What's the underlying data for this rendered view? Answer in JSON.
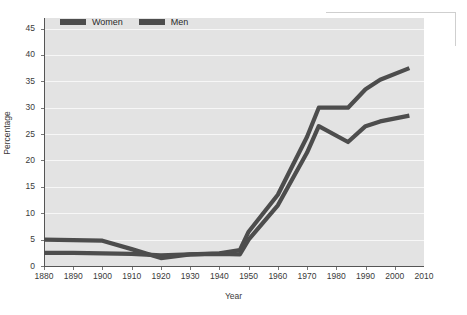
{
  "chart_data": {
    "type": "line",
    "title": "",
    "xlabel": "Year",
    "ylabel": "Percentage",
    "xlim": [
      1880,
      2010
    ],
    "ylim": [
      0,
      47
    ],
    "xticks": [
      1880,
      1890,
      1900,
      1910,
      1920,
      1930,
      1940,
      1950,
      1960,
      1970,
      1980,
      1990,
      2000,
      2010
    ],
    "yticks": [
      0,
      5,
      10,
      15,
      20,
      25,
      30,
      35,
      40,
      45
    ],
    "grid": "horizontal",
    "legend_position": "top-left-inside",
    "series": [
      {
        "name": "Women",
        "color": "#4d4d4d",
        "x": [
          1880,
          1890,
          1900,
          1910,
          1920,
          1930,
          1940,
          1947,
          1950,
          1960,
          1970,
          1974,
          1984,
          1990,
          1995,
          2005
        ],
        "values": [
          5.0,
          4.9,
          4.8,
          3.2,
          1.5,
          2.2,
          2.4,
          3.0,
          6.5,
          13.5,
          24.5,
          30.0,
          30.0,
          33.5,
          35.3,
          37.5
        ]
      },
      {
        "name": "Men",
        "color": "#4d4d4d",
        "x": [
          1880,
          1890,
          1900,
          1910,
          1920,
          1930,
          1940,
          1947,
          1950,
          1960,
          1970,
          1974,
          1984,
          1990,
          1995,
          2005
        ],
        "values": [
          2.5,
          2.5,
          2.4,
          2.3,
          2.0,
          2.2,
          2.3,
          2.2,
          5.0,
          11.5,
          21.5,
          26.5,
          23.5,
          26.5,
          27.4,
          28.5
        ]
      }
    ]
  },
  "legend": {
    "items": [
      {
        "label": "Women"
      },
      {
        "label": "Men"
      }
    ]
  },
  "axes": {
    "x_title": "Year",
    "y_title": "Percentage",
    "x_tick_labels": [
      "1880",
      "1890",
      "1900",
      "1910",
      "1920",
      "1930",
      "1940",
      "1950",
      "1960",
      "1970",
      "1980",
      "1990",
      "2000",
      "2010"
    ],
    "y_tick_labels": [
      "0",
      "5",
      "10",
      "15",
      "20",
      "25",
      "30",
      "35",
      "40",
      "45"
    ]
  },
  "colors": {
    "plot_background": "#e3e3e3",
    "gridline": "#f7f7f7",
    "series": "#4d4d4d",
    "axis": "#555555",
    "text": "#2a2a2a"
  }
}
